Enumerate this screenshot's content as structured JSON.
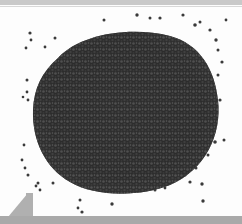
{
  "image": {
    "description": "Photograph of a heap of small dark granules (seeds) on a white background",
    "alt": "Pile of dark granules",
    "colors": {
      "background": "#fdfdfd",
      "granule_dark": "#2a2a2a",
      "granule_mid": "#555555",
      "granule_light": "#8a8a8a",
      "top_band": "#c9c9c9",
      "bottom_bar": "#a9a9a9"
    }
  }
}
